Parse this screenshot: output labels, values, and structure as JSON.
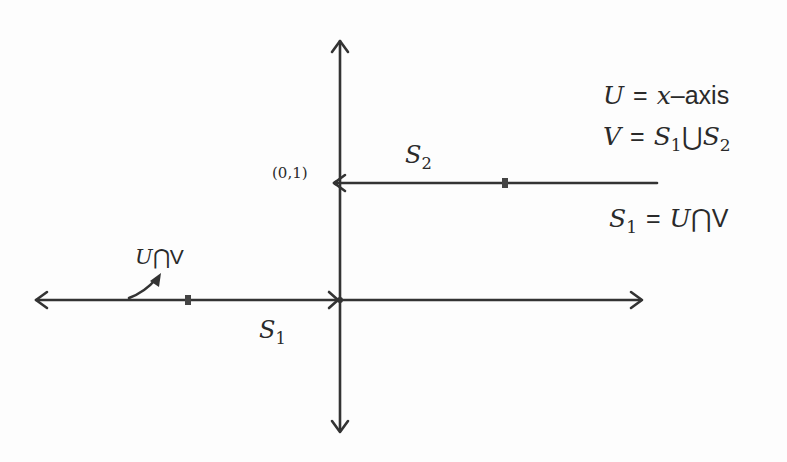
{
  "diagram": {
    "colors": {
      "line": "#333333",
      "text": "#2a2a2a",
      "background": "#fdfdfd"
    },
    "axes": {
      "horizontal": {
        "from": [
          35,
          300
        ],
        "to": [
          642,
          300
        ],
        "arrows": "both"
      },
      "vertical": {
        "from": [
          340,
          40
        ],
        "to": [
          340,
          432
        ],
        "arrows": "both"
      }
    },
    "segments": [
      {
        "name": "S2",
        "from": [
          333,
          183
        ],
        "to": [
          657,
          183
        ],
        "open_end_at": [
          333,
          183
        ],
        "tick_at": [
          505,
          183
        ]
      },
      {
        "name": "S1",
        "from": [
          35,
          300
        ],
        "to": [
          338,
          300
        ],
        "open_end_at": [
          338,
          300
        ],
        "tick_at": [
          188,
          300
        ]
      }
    ],
    "point_label": "(0,1)",
    "segment_labels": {
      "s2": {
        "var": "S",
        "sub": "2"
      },
      "s1": {
        "var": "S",
        "sub": "1"
      }
    },
    "intersection_label": {
      "u": "U",
      "cap": "⋂",
      "v": "V"
    },
    "legend": {
      "line1": {
        "lhs": "U",
        "eq": "=",
        "var": "x",
        "rest": "–axis"
      },
      "line2": {
        "lhs": "V",
        "eq": "=",
        "s": "S",
        "sub1": "1",
        "cup": "⋃",
        "s2": "S",
        "sub2": "2"
      },
      "line3": {
        "lhs": "S",
        "sub": "1",
        "eq": "=",
        "u": "U",
        "cap": "⋂",
        "v": "V"
      }
    }
  }
}
